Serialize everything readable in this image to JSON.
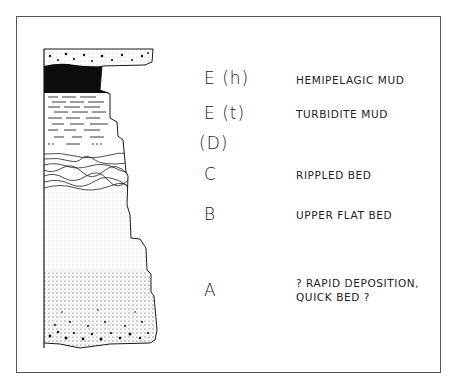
{
  "diagram": {
    "type": "stratigraphic-column",
    "intervals": [
      {
        "code": "E (h)",
        "description": "HEMIPELAGIC MUD"
      },
      {
        "code": "E (t)",
        "description": "TURBIDITE MUD"
      },
      {
        "code": "(D)",
        "description": ""
      },
      {
        "code": "C",
        "description": "RIPPLED BED"
      },
      {
        "code": "B",
        "description": "UPPER FLAT BED"
      },
      {
        "code": "A",
        "description": "? RAPID DEPOSITION,\nQUICK BED ?"
      }
    ],
    "colors": {
      "ink": "#1a1a1a",
      "background": "#ffffff",
      "frame": "#555555"
    }
  }
}
